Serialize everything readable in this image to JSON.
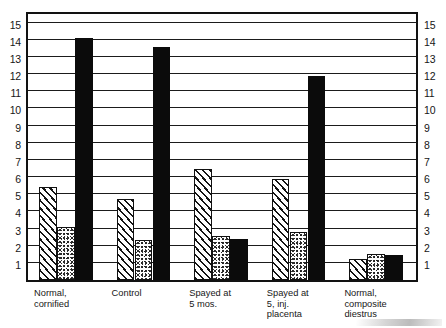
{
  "chart_data": {
    "type": "bar",
    "title": "",
    "subtitle": "",
    "xlabel": "",
    "ylabel": "",
    "ylim": [
      0,
      15.5
    ],
    "yticks": [
      1,
      2,
      3,
      4,
      5,
      6,
      7,
      8,
      9,
      10,
      11,
      12,
      13,
      14,
      15
    ],
    "ytick_labels": [
      "1",
      "2",
      "3",
      "4",
      "5",
      "6",
      "7",
      "8",
      "9",
      "10",
      "11",
      "12",
      "13",
      "14",
      "15"
    ],
    "grid": true,
    "grid_axis": "y",
    "legend": "none",
    "axis_left_labels": [
      "15",
      "14",
      "13",
      "12",
      "11",
      "10",
      "9",
      "8",
      "7",
      "6",
      "5",
      "4",
      "3",
      "2",
      "1"
    ],
    "axis_right_labels": [
      "15",
      "14",
      "13",
      "12",
      "11",
      "10",
      "9",
      "8",
      "7",
      "6",
      "5",
      "4",
      "3",
      "2",
      "1"
    ],
    "categories": [
      "Normal,\ncornified",
      "Control",
      "Spayed at\n5 mos.",
      "Spayed at\n5, inj.\nplacenta",
      "Normal,\ncomposite\ndiestrus"
    ],
    "series": [
      {
        "name": "series-hatched",
        "fill": "diagonal-hatch",
        "color": "#ffffff",
        "values": [
          5.4,
          4.7,
          6.45,
          5.9,
          1.25
        ]
      },
      {
        "name": "series-stippled",
        "fill": "stipple-dots",
        "color": "#fdfdfd",
        "values": [
          3.1,
          2.35,
          2.55,
          2.8,
          1.5
        ]
      },
      {
        "name": "series-solid",
        "fill": "solid",
        "color": "#0b0b0b",
        "values": [
          14.1,
          13.6,
          2.4,
          11.9,
          1.45
        ]
      }
    ]
  },
  "colors": {
    "frame": "#121212",
    "gridline": "#1b1b1b",
    "solid_bar": "#0b0b0b",
    "text": "#161616",
    "background": "#ffffff"
  }
}
